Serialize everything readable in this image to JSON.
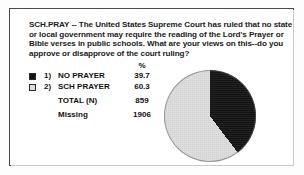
{
  "document": {
    "question_id": "SCH.PRAY",
    "question_text": "SCH.PRAY -- The United States Supreme Court has ruled that no state or local government may require the reading of the Lord's Prayer or Bible verses in public schools. What are your views on this--do you approve or disapprove of the court ruling?"
  },
  "table": {
    "percent_header": "%",
    "rows": [
      {
        "code": "1)",
        "label": "NO PRAYER",
        "value": "39.7",
        "swatch": "dark"
      },
      {
        "code": "2)",
        "label": "SCH PRAYER",
        "value": "60.3",
        "swatch": "light"
      }
    ],
    "total_label": "TOTAL  (N)",
    "total_value": "859",
    "missing_label": "Missing",
    "missing_value": "1906"
  },
  "colors": {
    "no_prayer": "#141414",
    "sch_prayer": "#dcdcdc",
    "border": "#4a4a4a",
    "text": "#111111"
  },
  "chart_data": {
    "type": "pie",
    "title": "",
    "categories": [
      "NO PRAYER",
      "SCH PRAYER"
    ],
    "values": [
      39.7,
      60.3
    ],
    "unit": "%",
    "colors": [
      "#141414",
      "#dcdcdc"
    ],
    "start_angle_deg": 0,
    "direction": "clockwise",
    "legend": "left",
    "n_total": 859,
    "n_missing": 1906,
    "labels_shown": false
  }
}
